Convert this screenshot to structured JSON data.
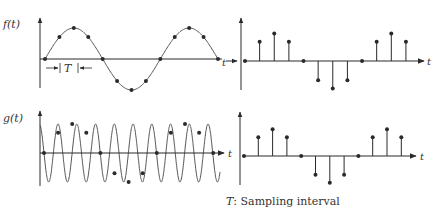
{
  "figure": {
    "caption_symbol": "T",
    "caption_text": ": Sampling interval",
    "colors": {
      "ink": "#2a2a2a",
      "curve": "#555555"
    }
  },
  "panels": {
    "top_left": {
      "ylabel": "f(t)",
      "xlabel": "t",
      "interval_label": "T",
      "signal": "continuous sinusoid, low frequency (~1.5 cycles)"
    },
    "top_right": {
      "xlabel": "t",
      "xlabel_left": "t",
      "signal": "sampled f(t)"
    },
    "bottom_left": {
      "ylabel": "g(t)",
      "xlabel": "t",
      "signal": "continuous sinusoid, high frequency (~9.5 cycles)"
    },
    "bottom_right": {
      "xlabel": "t",
      "xlabel_left": "t",
      "signal": "sampled g(t) (aliased, identical to sampled f(t))"
    }
  },
  "chart_data": {
    "type": "line",
    "samples_relative": [
      0,
      0.7,
      1,
      0.7,
      0,
      -0.7,
      -1,
      -0.7,
      0,
      0.7,
      1,
      0.7
    ],
    "note": "Both f(t) and g(t) yield identical sample sequences at interval T"
  }
}
